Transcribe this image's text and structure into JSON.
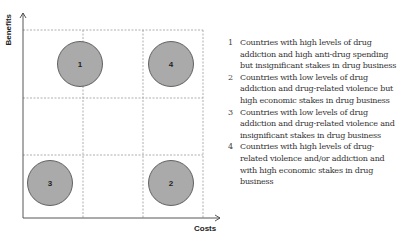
{
  "diagram": {
    "axes": {
      "y_label": "Benefits",
      "x_label": "Costs"
    },
    "grid": {
      "columns": 3,
      "rows": 3,
      "line_style": "dashed",
      "line_color": "#999999"
    },
    "circles": [
      {
        "id": "1",
        "label": "1",
        "cell": "top-left/top-middle boundary",
        "fill": "#aaaaaa"
      },
      {
        "id": "4",
        "label": "4",
        "cell": "top-right",
        "fill": "#aaaaaa"
      },
      {
        "id": "3",
        "label": "3",
        "cell": "bottom-left",
        "fill": "#aaaaaa"
      },
      {
        "id": "2",
        "label": "2",
        "cell": "bottom-right",
        "fill": "#aaaaaa"
      }
    ]
  },
  "legend": {
    "items": [
      {
        "number": "1",
        "text": "Countries with high levels of drug addiction and high anti-drug spending but insignificant stakes in drug business"
      },
      {
        "number": "2",
        "text": "Countries with low levels of drug addiction and drug-related violence but high economic stakes in drug business"
      },
      {
        "number": "3",
        "text": "Countries with low levels of drug addiction and drug-related violence and insignificant stakes in drug business"
      },
      {
        "number": "4",
        "text": "Countries with high levels of drug-related violence and/or addiction and with high economic stakes in drug business"
      }
    ]
  }
}
